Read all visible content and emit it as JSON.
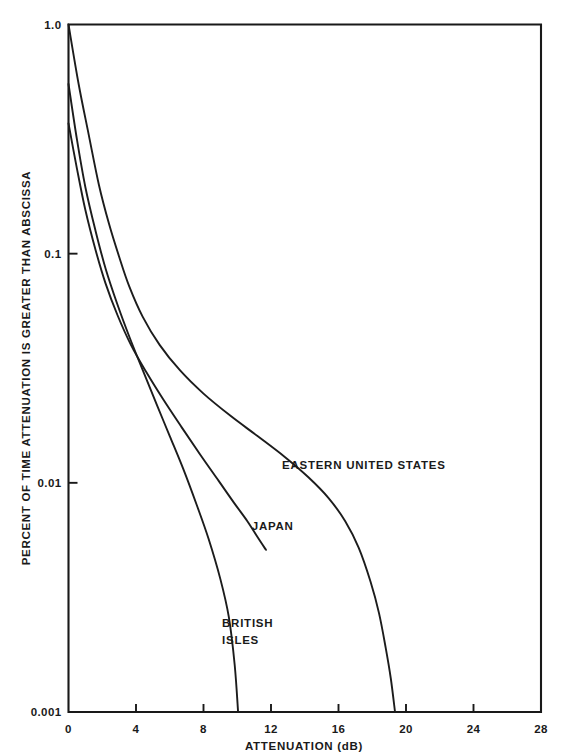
{
  "chart_data": {
    "type": "line",
    "title": "",
    "subtitle": "",
    "xlabel": "ATTENUATION (dB)",
    "ylabel": "PERCENT OF TIME ATTENUATION IS GREATER THAN ABSCISSA",
    "xlim": [
      0,
      28
    ],
    "ylim": [
      0.001,
      1.0
    ],
    "yscale": "log",
    "xscale": "linear",
    "grid": false,
    "legend_position": "inline-annotations",
    "xticks": [
      "0",
      "4",
      "8",
      "12",
      "16",
      "20",
      "24",
      "28"
    ],
    "xtick_values": [
      0,
      4,
      8,
      12,
      16,
      20,
      24,
      28
    ],
    "yticks": [
      "1.0",
      "0.1",
      "0.01",
      "0.001"
    ],
    "ytick_values": [
      1.0,
      0.1,
      0.01,
      0.001
    ],
    "series": [
      {
        "name": "EASTERN UNITED STATES",
        "label": "EASTERN UNITED STATES",
        "label_x": 17.5,
        "label_y": 0.0115,
        "points": [
          [
            0.0,
            1.0
          ],
          [
            0.6,
            0.55
          ],
          [
            1.2,
            0.33
          ],
          [
            1.8,
            0.2
          ],
          [
            2.4,
            0.135
          ],
          [
            3.0,
            0.097
          ],
          [
            3.6,
            0.072
          ],
          [
            4.4,
            0.053
          ],
          [
            5.4,
            0.04
          ],
          [
            6.6,
            0.031
          ],
          [
            8.0,
            0.0245
          ],
          [
            9.6,
            0.0196
          ],
          [
            11.2,
            0.016
          ],
          [
            12.8,
            0.013
          ],
          [
            14.2,
            0.0106
          ],
          [
            15.4,
            0.0086
          ],
          [
            16.4,
            0.0068
          ],
          [
            17.2,
            0.0052
          ],
          [
            17.9,
            0.0037
          ],
          [
            18.4,
            0.0027
          ],
          [
            18.8,
            0.0019
          ],
          [
            19.1,
            0.0014
          ],
          [
            19.35,
            0.001
          ]
        ]
      },
      {
        "name": "JAPAN",
        "label": "JAPAN",
        "label_x": 12.1,
        "label_y": 0.0062,
        "points": [
          [
            0.0,
            0.37
          ],
          [
            0.5,
            0.235
          ],
          [
            1.0,
            0.155
          ],
          [
            1.6,
            0.104
          ],
          [
            2.2,
            0.074
          ],
          [
            2.9,
            0.054
          ],
          [
            3.7,
            0.04
          ],
          [
            4.6,
            0.0305
          ],
          [
            5.6,
            0.0232
          ],
          [
            6.7,
            0.0175
          ],
          [
            7.8,
            0.0133
          ],
          [
            8.9,
            0.0102
          ],
          [
            9.8,
            0.0082
          ],
          [
            10.6,
            0.0068
          ],
          [
            11.2,
            0.0058
          ],
          [
            11.7,
            0.0051
          ]
        ]
      },
      {
        "name": "BRITISH ISLES",
        "label": "BRITISH ISLES",
        "label_line1": "BRITISH",
        "label_line2": "ISLES",
        "label_x": 9.1,
        "label_y": 0.00235,
        "points": [
          [
            0.0,
            0.55
          ],
          [
            0.5,
            0.315
          ],
          [
            1.0,
            0.195
          ],
          [
            1.6,
            0.126
          ],
          [
            2.2,
            0.086
          ],
          [
            2.9,
            0.06
          ],
          [
            3.6,
            0.0435
          ],
          [
            4.4,
            0.031
          ],
          [
            5.2,
            0.0222
          ],
          [
            6.0,
            0.016
          ],
          [
            6.8,
            0.0115
          ],
          [
            7.6,
            0.008
          ],
          [
            8.3,
            0.0057
          ],
          [
            9.0,
            0.0038
          ],
          [
            9.5,
            0.0026
          ],
          [
            9.85,
            0.0016
          ],
          [
            10.05,
            0.001
          ]
        ]
      }
    ]
  },
  "colors": {
    "curve": "#1c1c1c",
    "axis": "#191919",
    "background": "#ffffff"
  }
}
